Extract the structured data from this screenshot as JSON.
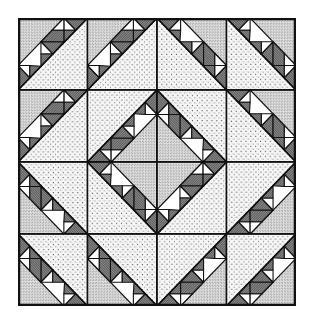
{
  "grid": {
    "rows": 4,
    "cols": 4
  },
  "colors": {
    "background": "#ffffff",
    "outline": "#111111",
    "light_fill": "#f4f4f4",
    "light_dot": "#555555",
    "dense_fill": "#d9d9d9",
    "dense_dot": "#222222",
    "dark_fill": "#6e6e6e",
    "white_fill": "#ffffff"
  },
  "cells": [
    [
      "BR",
      "BR",
      "BL",
      "BL"
    ],
    [
      "BR",
      "TL",
      "TR",
      "BL"
    ],
    [
      "TR",
      "BL",
      "BR",
      "TL"
    ],
    [
      "TR",
      "TR",
      "TL",
      "TL"
    ]
  ],
  "size": {
    "width": 278,
    "height": 288
  }
}
